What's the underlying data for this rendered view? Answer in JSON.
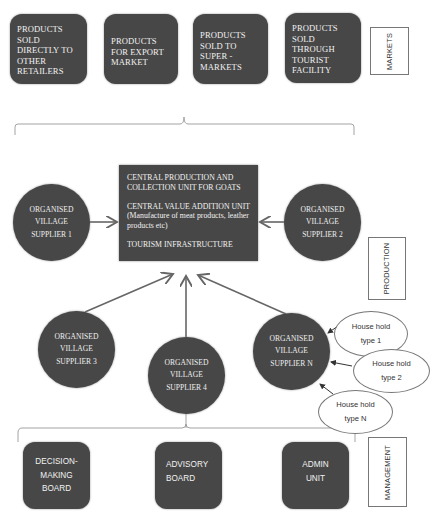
{
  "markets": {
    "label": "MARKETS",
    "boxes": [
      {
        "text": "PRODUCTS SOLD DIRECTLY TO OTHER RETAILERS"
      },
      {
        "text": "PRODUCTS FOR EXPORT MARKET"
      },
      {
        "text": "PRODUCTS SOLD TO SUPER - MARKETS"
      },
      {
        "text": "PRODUCTS SOLD THROUGH TOURIST FACILITY"
      }
    ]
  },
  "production": {
    "label": "PRODUCTION",
    "central_unit": {
      "line1": "CENTRAL PRODUCTION AND COLLECTION UNIT FOR GOATS",
      "line2": "CENTRAL VALUE ADDITION UNIT (Manufacture of meat products, leather products etc)",
      "line3": "TOURISM INFRASTRUCTURE"
    },
    "suppliers": [
      {
        "text": "ORGANISED VILLAGE SUPPLIER 1"
      },
      {
        "text": "ORGANISED VILLAGE SUPPLIER 2"
      },
      {
        "text": "ORGANISED VILLAGE SUPPLIER 3"
      },
      {
        "text": "ORGANISED VILLAGE SUPPLIER 4"
      },
      {
        "text": "ORGANISED VILLAGE SUPPLIER N"
      }
    ],
    "households": [
      {
        "text": "House hold type 1"
      },
      {
        "text": "House hold type 2"
      },
      {
        "text": "House hold type N"
      }
    ]
  },
  "management": {
    "label": "MANAGEMENT",
    "boxes": [
      {
        "text": "DECISION-MAKING BOARD"
      },
      {
        "text": "ADVISORY BOARD"
      },
      {
        "text": "ADMIN UNIT"
      }
    ]
  },
  "colors": {
    "box_fill": "#474747",
    "box_text": "#f2f2f2",
    "line": "#777777"
  }
}
